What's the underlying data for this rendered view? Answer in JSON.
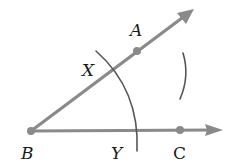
{
  "diagram": {
    "colors": {
      "ray": "#8a8a8a",
      "arc": "#555555",
      "label": "#1a1a1a",
      "background": "#ffffff"
    },
    "points": {
      "B": {
        "label": "B",
        "x": 31,
        "y": 131
      },
      "A": {
        "label": "A",
        "x": 137,
        "y": 51
      },
      "C": {
        "label": "C",
        "x": 180,
        "y": 130
      },
      "X": {
        "label": "X",
        "x": 114,
        "y": 68
      },
      "Y": {
        "label": "Y",
        "x": 137,
        "y": 131
      }
    },
    "rays": [
      {
        "name": "ray-BA",
        "from": "B",
        "through": "A"
      },
      {
        "name": "ray-BC",
        "from": "B",
        "through": "C"
      }
    ],
    "arcs": [
      {
        "name": "arc-XY",
        "center": "B",
        "intersects": [
          "X",
          "Y"
        ]
      },
      {
        "name": "arc-from-X-Y",
        "description": "small arc in the interior of the angle"
      }
    ],
    "labels": {
      "A": "A",
      "X": "X",
      "B": "B",
      "Y": "Y",
      "C": "C"
    }
  }
}
